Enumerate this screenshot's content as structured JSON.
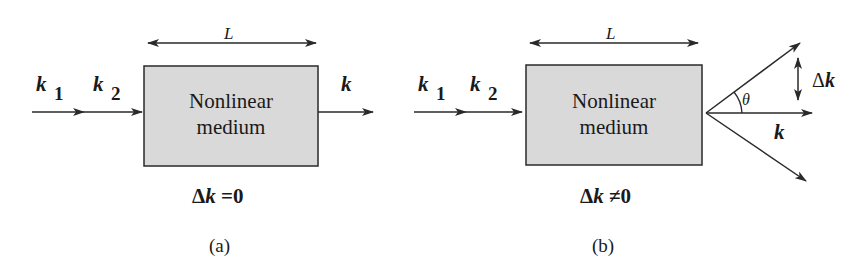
{
  "panels": [
    {
      "id": "a",
      "inputs": [
        {
          "symbol": "k",
          "subscript": "1"
        },
        {
          "symbol": "k",
          "subscript": "2"
        }
      ],
      "length_label": "L",
      "box_text_line1": "Nonlinear",
      "box_text_line2": "medium",
      "output": {
        "symbol": "k"
      },
      "condition": "Δk =0",
      "condition_delta": "Δ",
      "condition_k": "k",
      "condition_rel": " =0",
      "caption": "(a)"
    },
    {
      "id": "b",
      "inputs": [
        {
          "symbol": "k",
          "subscript": "1"
        },
        {
          "symbol": "k",
          "subscript": "2"
        }
      ],
      "length_label": "L",
      "box_text_line1": "Nonlinear",
      "box_text_line2": "medium",
      "output": {
        "symbol": "k"
      },
      "angle_label": "θ",
      "mismatch_label_delta": "Δ",
      "mismatch_label_k": "k",
      "condition": "Δk ≠0",
      "condition_delta": "Δ",
      "condition_k": "k",
      "condition_rel": " ≠0",
      "caption": "(b)"
    }
  ],
  "colors": {
    "box_fill": "#d9d9d9",
    "stroke": "#2a2a2a",
    "background": "#ffffff"
  }
}
